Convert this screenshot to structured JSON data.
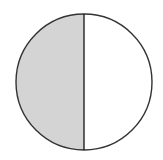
{
  "diagram": {
    "type": "fraction-circle",
    "parts_total": 2,
    "parts_shaded": 1,
    "shaded_side": "left",
    "colors": {
      "shade": "#d4d4d4",
      "unshaded": "#ffffff",
      "outline": "#333333",
      "background": "#ffffff"
    },
    "geometry": {
      "cx": 84,
      "cy": 82,
      "r": 68
    }
  }
}
